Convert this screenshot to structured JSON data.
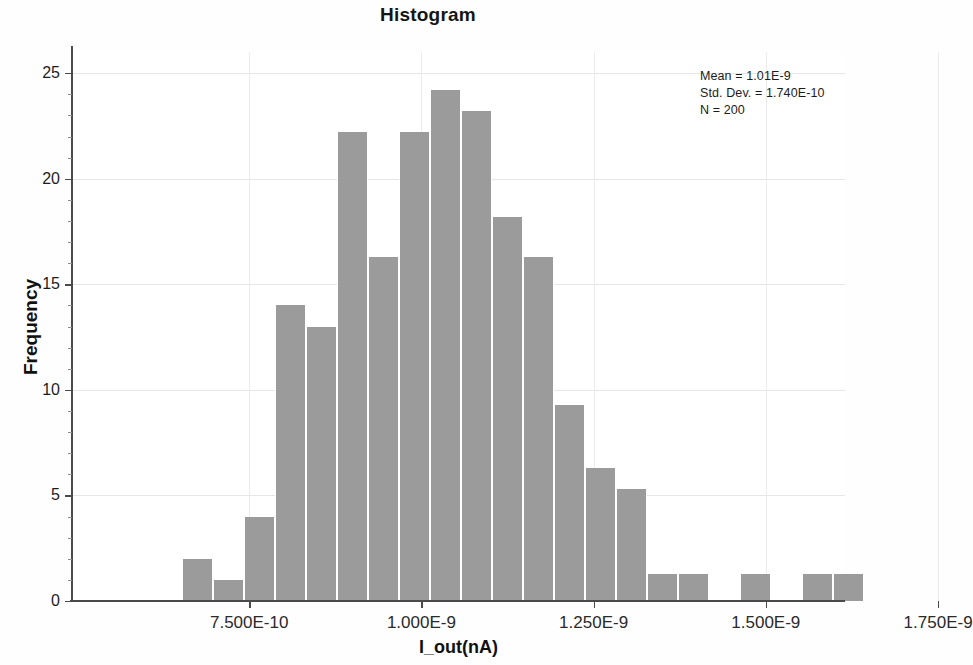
{
  "chart_data": {
    "type": "bar",
    "title": "Histogram",
    "xlabel": "I_out(nA)",
    "ylabel": "Frequency",
    "xlim": [
      6.25e-10,
      1.83e-09
    ],
    "ylim": [
      0,
      26
    ],
    "grid": true,
    "legend": "none",
    "bin_width": 4.5e-11,
    "x_tick_values": [
      7.5e-10,
      1e-09,
      1.25e-09,
      1.5e-09,
      1.75e-09
    ],
    "x_tick_labels": [
      "7.500E-10",
      "1.000E-9",
      "1.250E-9",
      "1.500E-9",
      "1.750E-9"
    ],
    "y_tick_values": [
      0,
      5,
      10,
      15,
      20,
      25
    ],
    "y_tick_labels": [
      "0",
      "5",
      "10",
      "15",
      "20",
      "25"
    ],
    "bin_centers": [
      6.75e-10,
      7.05e-10,
      7.35e-10,
      7.65e-10,
      7.95e-10,
      8.25e-10,
      8.55e-10,
      8.85e-10,
      9.15e-10,
      9.45e-10,
      9.75e-10,
      1.005e-09,
      1.035e-09,
      1.065e-09,
      1.095e-09,
      1.125e-09,
      1.155e-09,
      1.185e-09,
      1.215e-09,
      1.245e-09,
      1.275e-09,
      1.305e-09,
      1.335e-09,
      1.365e-09,
      1.395e-09,
      1.425e-09,
      1.455e-09,
      1.485e-09,
      1.515e-09,
      1.545e-09,
      1.575e-09,
      1.605e-09,
      1.635e-09,
      1.665e-09,
      1.695e-09,
      1.725e-09
    ],
    "values": [
      2,
      1,
      4,
      14,
      13,
      22,
      16,
      22,
      24,
      23,
      18,
      16,
      9,
      6,
      5,
      1,
      1,
      0,
      1,
      0,
      1,
      1
    ],
    "annotations": {
      "mean_label": "Mean = 1.01E-9",
      "std_dev_label": "Std. Dev. = 1.740E-10",
      "n_label": "N = 200"
    },
    "bar_color": "#9b9b9b",
    "axis_color": "#4a4a4a",
    "grid_color": "#e6e6e6"
  },
  "bars": [
    {
      "x": 110,
      "w": 31,
      "v": 2
    },
    {
      "x": 141,
      "w": 31,
      "v": 1
    },
    {
      "x": 172,
      "w": 31,
      "v": 4
    },
    {
      "x": 203,
      "w": 31,
      "v": 14
    },
    {
      "x": 234,
      "w": 31,
      "v": 13
    },
    {
      "x": 265,
      "w": 31,
      "v": 22.2
    },
    {
      "x": 296,
      "w": 31,
      "v": 16.3
    },
    {
      "x": 327,
      "w": 31,
      "v": 22.2
    },
    {
      "x": 358,
      "w": 31,
      "v": 24.2
    },
    {
      "x": 389,
      "w": 31,
      "v": 23.2
    },
    {
      "x": 420,
      "w": 31,
      "v": 18.2
    },
    {
      "x": 451,
      "w": 31,
      "v": 16.3
    },
    {
      "x": 482,
      "w": 31,
      "v": 9.3
    },
    {
      "x": 513,
      "w": 31,
      "v": 6.3
    },
    {
      "x": 544,
      "w": 31,
      "v": 5.3
    },
    {
      "x": 575,
      "w": 31,
      "v": 1.3
    },
    {
      "x": 606,
      "w": 31,
      "v": 1.3
    },
    {
      "x": 637,
      "w": 31,
      "v": 0
    },
    {
      "x": 668,
      "w": 31,
      "v": 1.3
    },
    {
      "x": 699,
      "w": 31,
      "v": 0
    },
    {
      "x": 730,
      "w": 31,
      "v": 1.3
    },
    {
      "x": 761,
      "w": 31,
      "v": 1.3
    }
  ],
  "chart": {
    "title": "Histogram",
    "x_axis_title": "I_out(nA)",
    "y_axis_title": "Frequency"
  },
  "stats": {
    "mean": "Mean = 1.01E-9",
    "std_dev": "Std. Dev. = 1.740E-10",
    "n": "N = 200"
  }
}
